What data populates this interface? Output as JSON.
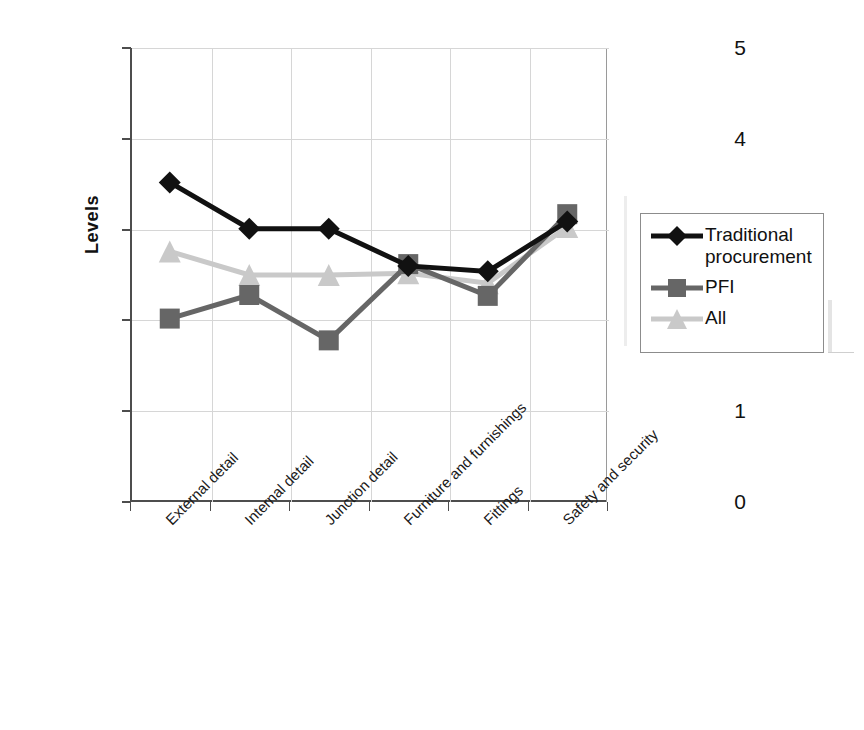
{
  "chart_data": {
    "type": "line",
    "title": "",
    "xlabel": "",
    "ylabel": "Levels",
    "ylim": [
      0,
      5
    ],
    "ytick_labels": [
      "5",
      "4",
      "3",
      "2",
      "1",
      "0"
    ],
    "ytick_values": [
      5,
      4,
      3,
      2,
      1,
      0
    ],
    "grid": true,
    "legend_position": "right",
    "categories": [
      "External detail",
      "Internal detail",
      "Junction detail",
      "Furniture and furnishings",
      "Fittings",
      "Safety and security"
    ],
    "series": [
      {
        "name": "Traditional procurement",
        "color": "#111111",
        "marker": "diamond",
        "values": [
          3.52,
          3.01,
          3.01,
          2.6,
          2.54,
          3.09
        ]
      },
      {
        "name": "PFI",
        "color": "#666666",
        "marker": "square",
        "values": [
          2.02,
          2.28,
          1.78,
          2.62,
          2.27,
          3.17
        ]
      },
      {
        "name": "All",
        "color": "#c9c9c9",
        "marker": "triangle",
        "values": [
          2.76,
          2.5,
          2.5,
          2.52,
          2.41,
          3.03
        ]
      }
    ]
  },
  "legend": {
    "entries": [
      {
        "label": "Traditional procurement",
        "color": "#111111",
        "marker": "diamond"
      },
      {
        "label": "PFI",
        "color": "#666666",
        "marker": "square"
      },
      {
        "label": "All",
        "color": "#c9c9c9",
        "marker": "triangle"
      }
    ]
  },
  "axis": {
    "y_title": "Levels",
    "y_ticks": [
      "5",
      "4",
      "3",
      "2",
      "1",
      "0"
    ],
    "x_ticks": [
      "External detail",
      "Internal detail",
      "Junction detail",
      "Furniture and furnishings",
      "Fittings",
      "Safety and security"
    ]
  }
}
